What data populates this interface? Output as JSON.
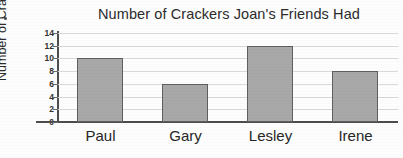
{
  "chart_data": {
    "type": "bar",
    "title": "Number of Crackers Joan's Friends Had",
    "xlabel": "",
    "ylabel": "Number of Crackers",
    "categories": [
      "Paul",
      "Gary",
      "Lesley",
      "Irene"
    ],
    "values": [
      10,
      6,
      12,
      8
    ],
    "ylim": [
      0,
      14
    ],
    "ytick_labels": [
      "0",
      "2",
      "4",
      "6",
      "8",
      "10",
      "12",
      "14"
    ],
    "ytick_values": [
      0,
      2,
      4,
      6,
      8,
      10,
      12,
      14
    ],
    "grid": true,
    "grid_axis": "y",
    "legend": false,
    "legend_position": "none",
    "bar_fill_color": "#a8a8a8",
    "bar_edge_color": "#5f5f5f",
    "gridline_color": "#d9d9d9",
    "axis_color": "#4d4d4d",
    "background_color": "#fdfdfd"
  }
}
